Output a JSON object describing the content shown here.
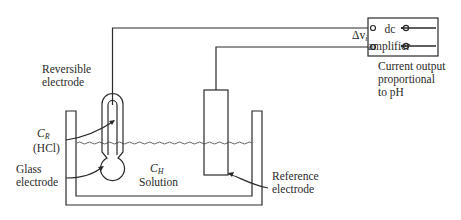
{
  "diagram": {
    "amplifier": {
      "line1": "dc",
      "line2": "amplifier",
      "input_label": "Δv",
      "input_sub": "i"
    },
    "output_label": [
      "Current output",
      "proportional",
      "to pH"
    ],
    "reversible_electrode_label": [
      "Reversible",
      "electrode"
    ],
    "cr_label": {
      "symbol": "C",
      "sub": "R",
      "paren": "(HCl)"
    },
    "glass_electrode_label": [
      "Glass",
      "electrode"
    ],
    "ch_label": {
      "symbol": "C",
      "sub": "H",
      "word": "Solution"
    },
    "reference_electrode_label": [
      "Reference",
      "electrode"
    ]
  }
}
